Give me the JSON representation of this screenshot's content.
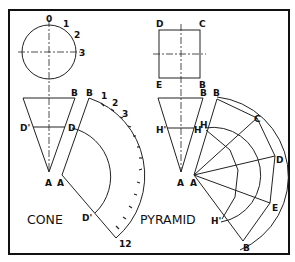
{
  "figure": {
    "frame": {
      "x": 9,
      "y": 10,
      "w": 280,
      "h": 244,
      "stroke": "#111111"
    },
    "line_color": "#222222",
    "cone": {
      "title": "CONE",
      "top_view": {
        "center": [
          49,
          52
        ],
        "radius": 27,
        "labels": [
          {
            "text": "0",
            "x": 46,
            "y": 22
          },
          {
            "text": "1",
            "x": 63,
            "y": 27
          },
          {
            "text": "2",
            "x": 74,
            "y": 38
          },
          {
            "text": "3",
            "x": 78,
            "y": 56
          }
        ]
      },
      "front_view": {
        "labels": [
          {
            "text": "B",
            "x": 71,
            "y": 96
          },
          {
            "text": "D'",
            "x": 20,
            "y": 129
          },
          {
            "text": "D",
            "x": 68,
            "y": 129
          },
          {
            "text": "A",
            "x": 45,
            "y": 185
          }
        ]
      },
      "development": {
        "apex": [
          62,
          175
        ],
        "labels": [
          {
            "text": "A",
            "x": 57,
            "y": 185
          },
          {
            "text": "B",
            "x": 86,
            "y": 96
          },
          {
            "text": "1",
            "x": 101,
            "y": 98
          },
          {
            "text": "2",
            "x": 112,
            "y": 105
          },
          {
            "text": "3",
            "x": 122,
            "y": 116
          },
          {
            "text": "D",
            "x": 68,
            "y": 129
          },
          {
            "text": "D'",
            "x": 82,
            "y": 221
          },
          {
            "text": "12",
            "x": 119,
            "y": 247
          }
        ]
      }
    },
    "pyramid": {
      "title": "PYRAMID",
      "top_view": {
        "labels": [
          {
            "text": "D",
            "x": 156,
            "y": 25
          },
          {
            "text": "C",
            "x": 199,
            "y": 25
          },
          {
            "text": "E",
            "x": 156,
            "y": 88
          },
          {
            "text": "B",
            "x": 199,
            "y": 88
          }
        ]
      },
      "front_view": {
        "labels": [
          {
            "text": "B",
            "x": 200,
            "y": 96
          },
          {
            "text": "H'",
            "x": 156,
            "y": 133
          },
          {
            "text": "H",
            "x": 195,
            "y": 133
          },
          {
            "text": "A",
            "x": 177,
            "y": 185
          }
        ]
      },
      "development": {
        "labels": [
          {
            "text": "A",
            "x": 191,
            "y": 185
          },
          {
            "text": "B",
            "x": 213,
            "y": 96
          },
          {
            "text": "H",
            "x": 201,
            "y": 129
          },
          {
            "text": "C",
            "x": 254,
            "y": 122
          },
          {
            "text": "D",
            "x": 276,
            "y": 163
          },
          {
            "text": "E",
            "x": 271,
            "y": 211
          },
          {
            "text": "H'",
            "x": 209,
            "y": 223
          },
          {
            "text": "B",
            "x": 243,
            "y": 250
          }
        ]
      }
    }
  }
}
